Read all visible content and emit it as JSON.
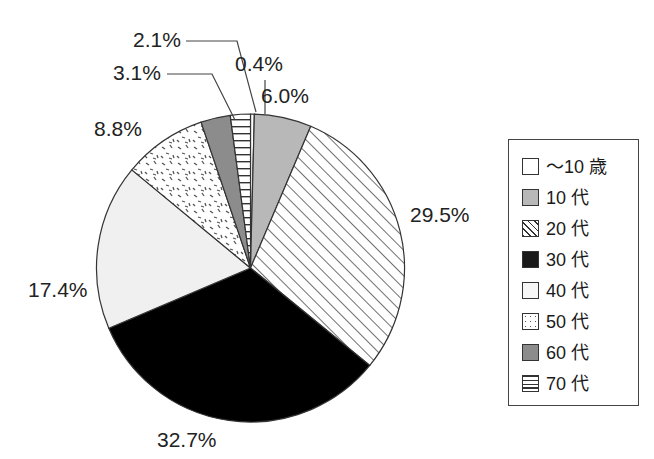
{
  "chart_data": {
    "type": "pie",
    "title": "",
    "subtitle": "",
    "xlabel": "",
    "ylabel": "",
    "legend_position": "right",
    "grid": false,
    "start_angle_deg": 0,
    "direction": "clockwise",
    "categories": [
      "～10 歳",
      "10 代",
      "20 代",
      "30 代",
      "40 代",
      "50 代",
      "60 代",
      "70 代"
    ],
    "values": [
      0.4,
      6.0,
      29.5,
      32.7,
      17.4,
      8.8,
      3.1,
      2.1
    ],
    "data_labels": [
      "0.4%",
      "6.0%",
      "29.5%",
      "32.7%",
      "17.4%",
      "8.8%",
      "3.1%",
      "2.1%"
    ],
    "slices": [
      {
        "label": "～10 歳",
        "value": 0.4,
        "data_label": "0.4%",
        "pattern": "solid-white",
        "fill": "#ffffff"
      },
      {
        "label": "10 代",
        "value": 6.0,
        "data_label": "6.0%",
        "pattern": "solid-gray",
        "fill": "#b8b8b8"
      },
      {
        "label": "20 代",
        "value": 29.5,
        "data_label": "29.5%",
        "pattern": "diagonal-hatch",
        "fill": "#ffffff"
      },
      {
        "label": "30 代",
        "value": 32.7,
        "data_label": "32.7%",
        "pattern": "solid-black",
        "fill": "#000000"
      },
      {
        "label": "40 代",
        "value": 17.4,
        "data_label": "17.4%",
        "pattern": "solid-very-light",
        "fill": "#f0f0f0"
      },
      {
        "label": "50 代",
        "value": 8.8,
        "data_label": "8.8%",
        "pattern": "stipple-dots",
        "fill": "#ffffff"
      },
      {
        "label": "60 代",
        "value": 3.1,
        "data_label": "3.1%",
        "pattern": "solid-dark-gray",
        "fill": "#8c8c8c"
      },
      {
        "label": "70 代",
        "value": 2.1,
        "data_label": "2.1%",
        "pattern": "horizontal-lines",
        "fill": "#ffffff"
      }
    ]
  },
  "labels": {
    "l_2_1": "2.1%",
    "l_3_1": "3.1%",
    "l_0_4": "0.4%",
    "l_6_0": "6.0%",
    "l_8_8": "8.8%",
    "l_29_5": "29.5%",
    "l_17_4": "17.4%",
    "l_32_7": "32.7%"
  },
  "legend": {
    "items": [
      {
        "label": "～10 歳",
        "pattern": "solid-white"
      },
      {
        "label": "10 代",
        "pattern": "solid-gray"
      },
      {
        "label": "20 代",
        "pattern": "diagonal-hatch"
      },
      {
        "label": "30 代",
        "pattern": "solid-black"
      },
      {
        "label": "40 代",
        "pattern": "solid-very-light"
      },
      {
        "label": "50 代",
        "pattern": "stipple-dots"
      },
      {
        "label": "60 代",
        "pattern": "solid-dark-gray"
      },
      {
        "label": "70 代",
        "pattern": "horizontal-lines"
      }
    ]
  },
  "colors": {
    "outline": "#333333",
    "text": "#1a1a1a",
    "black_slice": "#000000",
    "gray_10dai": "#b8b8b8",
    "gray_60dai": "#8c8c8c",
    "light_40dai": "#f0f0f0",
    "background": "#ffffff"
  }
}
